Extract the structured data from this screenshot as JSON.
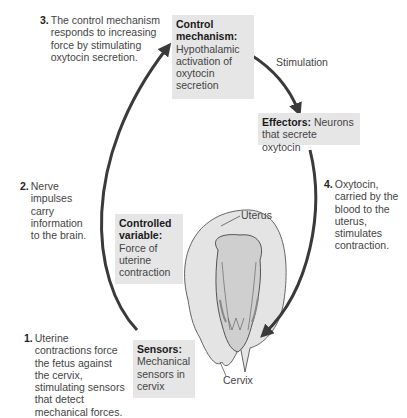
{
  "steps": [
    {
      "num": "1.",
      "text": "Uterine contractions force the fetus against the cervix, stimulating sensors that detect mechanical forces."
    },
    {
      "num": "2.",
      "text": "Nerve impulses carry information to the brain."
    },
    {
      "num": "3.",
      "text": "The control mechanism responds to increasing force by stimulating oxytocin secretion."
    },
    {
      "num": "4.",
      "text": "Oxytocin, carried by the blood to the uterus, stimulates contraction."
    }
  ],
  "boxes": {
    "control_mechanism": {
      "title": "Control mechanism:",
      "body": "Hypothalamic activation of oxytocin secretion"
    },
    "effectors": {
      "title": "Effectors:",
      "body": "Neurons that secrete oxytocin"
    },
    "controlled_variable": {
      "title": "Controlled variable:",
      "body": "Force of uterine contraction"
    },
    "sensors": {
      "title": "Sensors:",
      "body": "Mechanical sensors in cervix"
    }
  },
  "labels": {
    "stimulation": "Stimulation",
    "uterus": "Uterus",
    "cervix": "Cervix"
  },
  "colors": {
    "arrow": "#3a3a3a",
    "box_fill": "#e6e6e6",
    "uterus_fill": "#e4e4e4"
  }
}
